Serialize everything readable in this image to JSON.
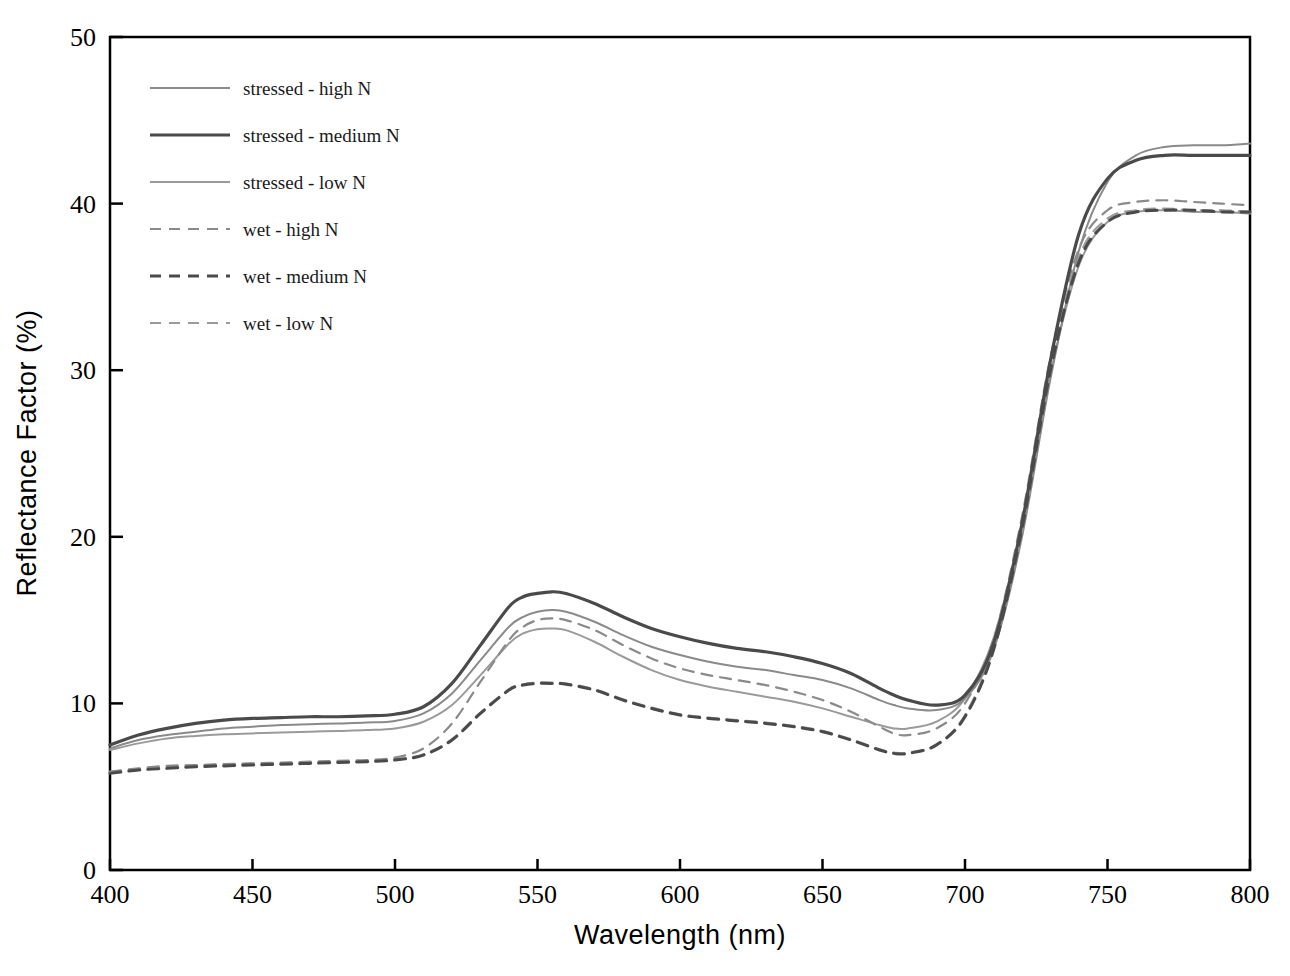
{
  "chart_data": {
    "type": "line",
    "title": "",
    "xlabel": "Wavelength  (nm)",
    "ylabel": "Reflectance  Factor  (%)",
    "xlim": [
      400,
      800
    ],
    "ylim": [
      0,
      50
    ],
    "xticks": [
      400,
      450,
      500,
      550,
      600,
      650,
      700,
      750,
      800
    ],
    "yticks": [
      0,
      10,
      20,
      30,
      40,
      50
    ],
    "grid": false,
    "legend_position": "upper-left",
    "x": [
      400,
      410,
      420,
      430,
      440,
      450,
      460,
      470,
      480,
      490,
      500,
      510,
      520,
      530,
      540,
      545,
      550,
      555,
      560,
      570,
      580,
      590,
      600,
      610,
      620,
      630,
      640,
      650,
      660,
      670,
      675,
      680,
      690,
      700,
      710,
      720,
      730,
      740,
      750,
      760,
      770,
      780,
      790,
      800
    ],
    "series": [
      {
        "name": "stressed - high N",
        "style": "solid",
        "color": "#8a8a8a",
        "width": 2.0,
        "values": [
          7.3,
          7.8,
          8.1,
          8.3,
          8.5,
          8.6,
          8.7,
          8.75,
          8.8,
          8.85,
          8.95,
          9.4,
          10.6,
          12.6,
          14.6,
          15.2,
          15.5,
          15.6,
          15.5,
          14.9,
          14.1,
          13.4,
          12.9,
          12.5,
          12.2,
          12.0,
          11.7,
          11.4,
          10.9,
          10.2,
          9.9,
          9.7,
          9.6,
          10.3,
          13.2,
          20.0,
          29.5,
          37.2,
          41.3,
          42.9,
          43.4,
          43.5,
          43.5,
          43.6
        ]
      },
      {
        "name": "stressed - medium N",
        "style": "solid",
        "color": "#4a4a4a",
        "width": 3.2,
        "values": [
          7.5,
          8.1,
          8.5,
          8.8,
          9.0,
          9.1,
          9.15,
          9.2,
          9.2,
          9.25,
          9.35,
          9.8,
          11.2,
          13.5,
          15.8,
          16.4,
          16.6,
          16.7,
          16.6,
          16.0,
          15.2,
          14.5,
          14.0,
          13.6,
          13.3,
          13.1,
          12.8,
          12.4,
          11.8,
          10.9,
          10.5,
          10.2,
          9.9,
          10.5,
          13.6,
          20.8,
          30.6,
          38.2,
          41.5,
          42.6,
          42.9,
          42.9,
          42.9,
          42.9
        ]
      },
      {
        "name": "stressed - low N",
        "style": "solid",
        "color": "#9a9a9a",
        "width": 2.0,
        "values": [
          7.2,
          7.6,
          7.9,
          8.05,
          8.15,
          8.2,
          8.25,
          8.3,
          8.35,
          8.4,
          8.5,
          8.9,
          9.9,
          11.7,
          13.6,
          14.2,
          14.45,
          14.5,
          14.4,
          13.7,
          12.8,
          12.0,
          11.4,
          11.0,
          10.7,
          10.4,
          10.1,
          9.7,
          9.2,
          8.7,
          8.5,
          8.5,
          8.9,
          10.3,
          13.9,
          20.8,
          29.8,
          36.3,
          38.9,
          39.5,
          39.6,
          39.5,
          39.5,
          39.4
        ]
      },
      {
        "name": "wet - high N",
        "style": "dashed",
        "color": "#8a8a8a",
        "width": 2.2,
        "values": [
          5.9,
          6.1,
          6.25,
          6.3,
          6.35,
          6.4,
          6.45,
          6.5,
          6.55,
          6.6,
          6.75,
          7.3,
          8.8,
          11.3,
          13.8,
          14.6,
          15.0,
          15.1,
          15.0,
          14.4,
          13.5,
          12.7,
          12.1,
          11.7,
          11.4,
          11.1,
          10.7,
          10.2,
          9.5,
          8.6,
          8.2,
          8.1,
          8.5,
          10.0,
          13.8,
          21.2,
          30.8,
          37.3,
          39.6,
          40.1,
          40.2,
          40.1,
          40.0,
          39.9
        ]
      },
      {
        "name": "wet - medium N",
        "style": "dashed",
        "color": "#4a4a4a",
        "width": 3.0,
        "values": [
          5.8,
          6.0,
          6.1,
          6.2,
          6.25,
          6.3,
          6.35,
          6.4,
          6.45,
          6.5,
          6.6,
          6.9,
          7.8,
          9.4,
          10.8,
          11.1,
          11.2,
          11.2,
          11.15,
          10.8,
          10.2,
          9.7,
          9.3,
          9.1,
          8.95,
          8.8,
          8.6,
          8.3,
          7.8,
          7.2,
          7.0,
          7.0,
          7.5,
          9.2,
          13.2,
          20.5,
          30.0,
          36.5,
          38.9,
          39.5,
          39.6,
          39.6,
          39.5,
          39.5
        ]
      },
      {
        "name": "wet - low N",
        "style": "dashed",
        "color": "#9a9a9a",
        "width": 2.2,
        "values": [
          5.85,
          6.05,
          6.2,
          6.28,
          6.33,
          6.38,
          6.42,
          6.47,
          6.5,
          6.55,
          6.65,
          6.95,
          7.85,
          9.45,
          10.85,
          11.15,
          11.25,
          11.25,
          11.2,
          10.85,
          10.25,
          9.75,
          9.35,
          9.15,
          9.0,
          8.85,
          8.65,
          8.35,
          7.85,
          7.25,
          7.05,
          7.05,
          7.55,
          9.3,
          13.4,
          20.8,
          30.3,
          36.8,
          39.1,
          39.6,
          39.7,
          39.6,
          39.6,
          39.5
        ]
      }
    ]
  },
  "legend": {
    "entries": [
      {
        "label": "stressed - high N"
      },
      {
        "label": "stressed - medium N"
      },
      {
        "label": "stressed - low N"
      },
      {
        "label": "wet - high N"
      },
      {
        "label": "wet - medium N"
      },
      {
        "label": "wet - low N"
      }
    ]
  },
  "axes": {
    "x_title": "Wavelength  (nm)",
    "y_title": "Reflectance  Factor  (%)",
    "x_tick_labels": [
      "400",
      "450",
      "500",
      "550",
      "600",
      "650",
      "700",
      "750",
      "800"
    ],
    "y_tick_labels": [
      "0",
      "10",
      "20",
      "30",
      "40",
      "50"
    ]
  }
}
